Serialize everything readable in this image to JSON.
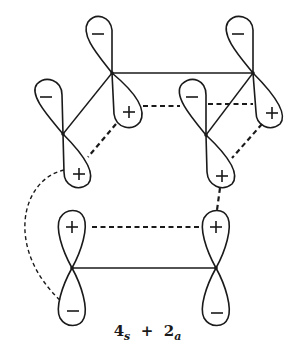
{
  "diagram": {
    "caption": {
      "term1_number": "4",
      "term1_sub": "s",
      "operator": "+",
      "term2_number": "2",
      "term2_sub": "a"
    },
    "nodes": [
      {
        "id": "A",
        "x": 112,
        "y": 73
      },
      {
        "id": "B",
        "x": 253,
        "y": 73
      },
      {
        "id": "C",
        "x": 206,
        "y": 135
      },
      {
        "id": "D",
        "x": 63,
        "y": 134
      },
      {
        "id": "E",
        "x": 72,
        "y": 268
      },
      {
        "id": "F",
        "x": 216,
        "y": 268
      }
    ],
    "lobe_signs": {
      "A_upper": "−",
      "A_lower": "+",
      "B_upper": "−",
      "B_lower": "+",
      "C_upper": "−",
      "C_lower": "+",
      "D_upper": "−",
      "D_lower": "+",
      "E_upper": "+",
      "E_lower": "−",
      "F_upper": "+",
      "F_lower": "−"
    },
    "bonds_solid": [
      "A-B",
      "A-D",
      "B-C",
      "E-F"
    ],
    "interactions_dashed": [
      "A+ to C−",
      "C− to B+",
      "A+ to D+",
      "B+ to C+",
      "C+ to F+",
      "E+ to F+",
      "D+ to E− (arc)"
    ]
  }
}
